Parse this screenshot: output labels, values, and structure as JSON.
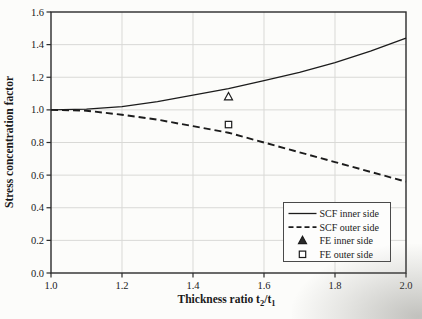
{
  "figure": {
    "background": "#fcfcfa",
    "frame_color": "#2b2b2b",
    "grid_color": "#d9d9d6",
    "text_color": "#1a1a1a",
    "legend_border_color": "#4a4a4a"
  },
  "chart_data": {
    "type": "line",
    "title": "",
    "xlabel": "Thickness ratio t2/t1",
    "xlabel_parts": [
      {
        "text": "Thickness ratio t",
        "sub": false
      },
      {
        "text": "2",
        "sub": true
      },
      {
        "text": "/t",
        "sub": false
      },
      {
        "text": "1",
        "sub": true
      }
    ],
    "ylabel": "Stress concentration factor",
    "xlim": [
      1.0,
      2.0
    ],
    "ylim": [
      0.0,
      1.6
    ],
    "grid": true,
    "legend_position": "lower right",
    "xticks": [
      {
        "v": 1.0,
        "label": "1.0"
      },
      {
        "v": 1.2,
        "label": "1.2"
      },
      {
        "v": 1.4,
        "label": "1.4"
      },
      {
        "v": 1.6,
        "label": "1.6"
      },
      {
        "v": 1.8,
        "label": "1.8"
      },
      {
        "v": 2.0,
        "label": "2.0"
      }
    ],
    "yticks": [
      {
        "v": 0.0,
        "label": "0.0"
      },
      {
        "v": 0.2,
        "label": "0.2"
      },
      {
        "v": 0.4,
        "label": "0.4"
      },
      {
        "v": 0.6,
        "label": "0.6"
      },
      {
        "v": 0.8,
        "label": "0.8"
      },
      {
        "v": 1.0,
        "label": "1.0"
      },
      {
        "v": 1.2,
        "label": "1.2"
      },
      {
        "v": 1.4,
        "label": "1.4"
      },
      {
        "v": 1.6,
        "label": "1.6"
      }
    ],
    "x": [
      1.0,
      1.1,
      1.2,
      1.3,
      1.4,
      1.5,
      1.6,
      1.7,
      1.8,
      1.9,
      2.0
    ],
    "series": [
      {
        "name": "SCF inner side",
        "style": "solid",
        "color": "#1c1c1c",
        "values": [
          1.0,
          1.005,
          1.02,
          1.05,
          1.09,
          1.13,
          1.18,
          1.23,
          1.29,
          1.36,
          1.44
        ]
      },
      {
        "name": "SCF outer side",
        "style": "dashed",
        "color": "#1c1c1c",
        "values": [
          1.0,
          0.995,
          0.97,
          0.94,
          0.9,
          0.86,
          0.8,
          0.74,
          0.68,
          0.62,
          0.56
        ]
      }
    ],
    "points": [
      {
        "name": "FE inner side",
        "marker": "triangle",
        "x": 1.5,
        "y": 1.08,
        "color": "#1c1c1c"
      },
      {
        "name": "FE outer side",
        "marker": "square",
        "x": 1.5,
        "y": 0.91,
        "color": "#1c1c1c"
      }
    ],
    "legend_items": [
      {
        "label": "SCF inner side",
        "glyph": "solid-line"
      },
      {
        "label": "SCF outer side",
        "glyph": "dashed-line"
      },
      {
        "label": "FE inner side",
        "glyph": "triangle"
      },
      {
        "label": "FE outer side",
        "glyph": "square"
      }
    ]
  }
}
